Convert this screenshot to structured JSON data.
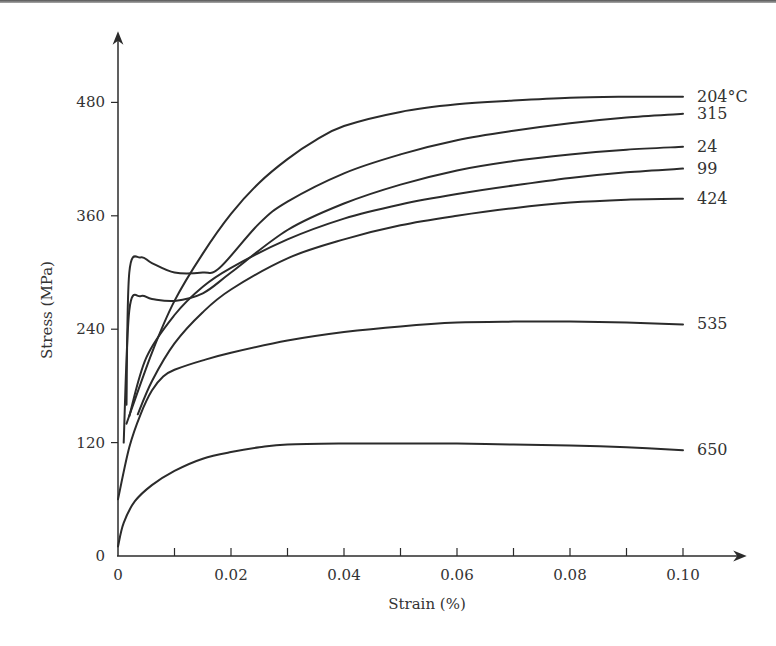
{
  "chart_data": {
    "type": "line",
    "title": "",
    "xlabel": "Strain (%)",
    "ylabel": "Stress (MPa)",
    "xlim": [
      0,
      0.1
    ],
    "ylim": [
      0,
      480
    ],
    "grid": false,
    "legend_position": "inline-right",
    "x_ticks": [
      "0",
      "0.02",
      "0.04",
      "0.06",
      "0.08",
      "0.10"
    ],
    "x_tick_values": [
      0,
      0.02,
      0.04,
      0.06,
      0.08,
      0.1
    ],
    "x_minor_ticks": [
      0.01,
      0.03,
      0.05,
      0.07,
      0.09
    ],
    "y_ticks": [
      "0",
      "120",
      "240",
      "360",
      "480"
    ],
    "y_tick_values": [
      0,
      120,
      240,
      360,
      480
    ],
    "series": [
      {
        "name": "204°C",
        "label": "204°C",
        "x": [
          0.0015,
          0.006,
          0.01,
          0.015,
          0.02,
          0.025,
          0.03,
          0.035,
          0.04,
          0.05,
          0.06,
          0.07,
          0.08,
          0.09,
          0.1
        ],
        "y": [
          140,
          215,
          270,
          320,
          362,
          395,
          420,
          440,
          455,
          470,
          478,
          482,
          485,
          486,
          486
        ]
      },
      {
        "name": "315°C",
        "label": "315",
        "x": [
          0.0015,
          0.002,
          0.004,
          0.006,
          0.01,
          0.015,
          0.018,
          0.025,
          0.03,
          0.04,
          0.05,
          0.06,
          0.07,
          0.08,
          0.09,
          0.1
        ],
        "y": [
          160,
          300,
          316,
          310,
          300,
          300,
          305,
          352,
          375,
          405,
          425,
          440,
          450,
          458,
          464,
          468
        ]
      },
      {
        "name": "24°C",
        "label": "24",
        "x": [
          0.001,
          0.002,
          0.004,
          0.006,
          0.01,
          0.015,
          0.02,
          0.03,
          0.04,
          0.05,
          0.06,
          0.07,
          0.08,
          0.09,
          0.1
        ],
        "y": [
          120,
          260,
          275,
          272,
          270,
          278,
          300,
          345,
          373,
          393,
          408,
          418,
          425,
          430,
          433
        ]
      },
      {
        "name": "99°C",
        "label": "99",
        "x": [
          0.002,
          0.005,
          0.01,
          0.015,
          0.02,
          0.03,
          0.04,
          0.05,
          0.06,
          0.07,
          0.08,
          0.09,
          0.1
        ],
        "y": [
          148,
          210,
          255,
          285,
          305,
          335,
          357,
          372,
          383,
          392,
          400,
          406,
          410
        ]
      },
      {
        "name": "424°C",
        "label": "424",
        "x": [
          0.0035,
          0.006,
          0.01,
          0.015,
          0.02,
          0.03,
          0.04,
          0.05,
          0.06,
          0.07,
          0.08,
          0.09,
          0.1
        ],
        "y": [
          150,
          185,
          225,
          258,
          282,
          315,
          335,
          350,
          360,
          368,
          374,
          377,
          378
        ]
      },
      {
        "name": "535°C",
        "label": "535",
        "x": [
          0.0,
          0.002,
          0.004,
          0.006,
          0.008,
          0.01,
          0.015,
          0.02,
          0.03,
          0.04,
          0.05,
          0.06,
          0.07,
          0.08,
          0.09,
          0.1
        ],
        "y": [
          60,
          115,
          150,
          175,
          190,
          197,
          207,
          215,
          228,
          237,
          243,
          247,
          248,
          248,
          247,
          245
        ]
      },
      {
        "name": "650°C",
        "label": "650",
        "x": [
          0.0,
          0.001,
          0.003,
          0.006,
          0.01,
          0.015,
          0.02,
          0.025,
          0.03,
          0.04,
          0.05,
          0.06,
          0.07,
          0.08,
          0.09,
          0.1
        ],
        "y": [
          10,
          35,
          58,
          75,
          90,
          103,
          110,
          115,
          118,
          119,
          119,
          119,
          118,
          117,
          115,
          112
        ]
      }
    ]
  },
  "axes": {
    "x_title": "Strain (%)",
    "y_title": "Stress (MPa)"
  }
}
